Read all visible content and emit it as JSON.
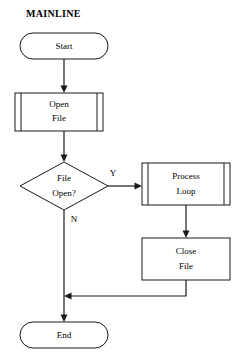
{
  "diagram": {
    "title": "MAINLINE",
    "type": "flowchart",
    "background_color": "#ffffff",
    "line_color": "#1a1a1a",
    "text_color": "#000000"
  },
  "nodes": {
    "start": {
      "label": "Start",
      "shape": "terminator",
      "x": 20,
      "y": 33,
      "w": 88,
      "h": 26
    },
    "open_file": {
      "label_line1": "Open",
      "label_line2": "File",
      "shape": "predefined-process",
      "x": 15,
      "y": 93,
      "w": 88,
      "h": 38
    },
    "decision": {
      "label_line1": "File",
      "label_line2": "Open?",
      "shape": "decision",
      "x": 20,
      "y": 162,
      "w": 88,
      "h": 48
    },
    "process_loop": {
      "label_line1": "Process",
      "label_line2": "Loop",
      "shape": "predefined-process",
      "x": 142,
      "y": 163,
      "w": 88,
      "h": 42
    },
    "close_file": {
      "label_line1": "Close",
      "label_line2": "File",
      "shape": "process",
      "x": 142,
      "y": 238,
      "w": 88,
      "h": 42
    },
    "end": {
      "label": "End",
      "shape": "terminator",
      "x": 20,
      "y": 322,
      "w": 88,
      "h": 26
    }
  },
  "branch_labels": {
    "yes": "Y",
    "no": "N"
  }
}
